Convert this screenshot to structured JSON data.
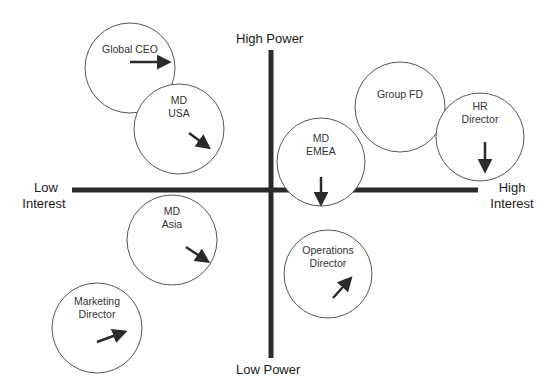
{
  "diagram": {
    "type": "stakeholder-power-interest-map",
    "axes": {
      "y_top": "High Power",
      "y_bottom": "Low Power",
      "x_left_line1": "Low",
      "x_left_line2": "Interest",
      "x_right_line1": "High",
      "x_right_line2": "Interest"
    },
    "colors": {
      "axis": "#2a2a2a",
      "circle": "#555555",
      "arrow": "#2a2a2a",
      "text": "#333333"
    },
    "stakeholders": [
      {
        "name": "Global CEO",
        "cx": 130,
        "cy": 68,
        "r": 45,
        "label_y": 43,
        "arrow": {
          "x1": 130,
          "y1": 62,
          "x2": 168,
          "y2": 62,
          "direction": "right"
        }
      },
      {
        "name": "MD\nUSA",
        "cx": 179,
        "cy": 129,
        "r": 45,
        "label_y": 94,
        "arrow": {
          "x1": 189,
          "y1": 133,
          "x2": 208,
          "y2": 147,
          "direction": "down-right"
        }
      },
      {
        "name": "Group FD",
        "cx": 400,
        "cy": 107,
        "r": 45,
        "label_y": 88,
        "arrow": null
      },
      {
        "name": "HR\nDirector",
        "cx": 480,
        "cy": 137,
        "r": 44,
        "label_y": 100,
        "arrow": {
          "x1": 485,
          "y1": 142,
          "x2": 485,
          "y2": 170,
          "direction": "down"
        }
      },
      {
        "name": "MD\nEMEA",
        "cx": 321,
        "cy": 162,
        "r": 44,
        "label_y": 132,
        "arrow": {
          "x1": 321,
          "y1": 177,
          "x2": 321,
          "y2": 203,
          "direction": "down"
        }
      },
      {
        "name": "MD\nAsia",
        "cx": 172,
        "cy": 240,
        "r": 45,
        "label_y": 205,
        "arrow": {
          "x1": 186,
          "y1": 247,
          "x2": 207,
          "y2": 261,
          "direction": "down-right"
        }
      },
      {
        "name": "Marketing\nDirector",
        "cx": 97,
        "cy": 328,
        "r": 45,
        "label_y": 295,
        "arrow": {
          "x1": 97,
          "y1": 342,
          "x2": 124,
          "y2": 332,
          "direction": "up-right"
        }
      },
      {
        "name": "Operations\nDirector",
        "cx": 328,
        "cy": 274,
        "r": 44,
        "label_y": 244,
        "arrow": {
          "x1": 333,
          "y1": 298,
          "x2": 350,
          "y2": 279,
          "direction": "up-right"
        }
      }
    ]
  }
}
